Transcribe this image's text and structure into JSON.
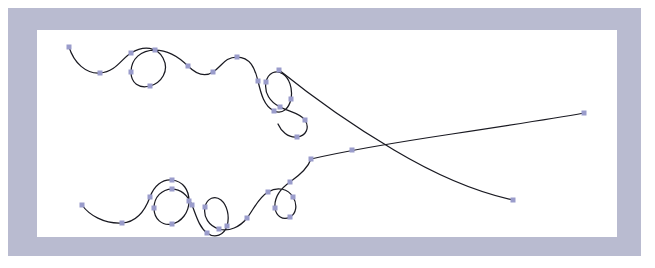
{
  "app": {
    "document_title": "Vector Curve Canvas",
    "view_label": "Artboard"
  },
  "colors": {
    "frame_background": "#b9bbd0",
    "canvas_background": "#ffffff",
    "page_background": "#ffffff",
    "stroke": "#1a1a22",
    "anchor_fill": "#9a9ccb"
  },
  "frame": {
    "x": 8,
    "y": 8,
    "width": 633,
    "height": 248
  },
  "canvas": {
    "x": 37,
    "y": 30,
    "width": 580,
    "height": 207
  },
  "artwork": {
    "stroke_width": 1.25,
    "anchor_size": 5,
    "paths": [
      {
        "id": "upper-path",
        "name": "upper-serpentine-curve",
        "d": "M 69 47 C 74 63 86 74 100 73 C 116 72 122 58 131 53 C 144 45 157 47 163 58 C 170 71 161 83 150 86 C 139 89 131 83 131 72 C 131 59 141 50 155 50 C 170 50 180 58 188 66 C 196 74 204 78 213 72 C 222 66 225 57 237 57 C 250 57 255 68 258 81 C 261 94 264 106 274 111 C 283 115 289 108 291 99 C 293 88 289 78 283 74 C 276 69 268 73 266 82 C 264 93 270 102 280 107 C 290 112 300 113 305 120 C 310 128 306 136 297 137 C 288 138 281 131 278 124"
      },
      {
        "id": "lower-path",
        "name": "lower-serpentine-curve",
        "d": "M 82 205 C 89 215 104 224 122 223 C 139 222 146 208 150 197 C 154 186 162 179 172 180 C 183 181 189 190 189 201 C 189 213 181 222 172 224 C 162 226 154 219 154 208 C 154 197 162 189 172 189 C 182 189 188 196 192 205 C 196 215 199 227 207 233 C 215 239 224 235 227 226 C 230 216 227 205 221 200 C 215 195 207 198 205 207 C 203 217 209 226 219 229 C 229 232 240 227 247 218 C 254 209 258 198 268 192 C 278 186 288 189 293 197 C 298 205 296 214 290 217 C 283 221 276 216 275 208 C 274 198 280 189 290 182 C 300 175 308 168 311 159"
      },
      {
        "id": "diagonal-descending",
        "name": "descending-diagonal-tail",
        "d": "M 279 70 C 310 95 350 124 394 150 C 436 175 476 192 513 200"
      },
      {
        "id": "diagonal-ascending",
        "name": "ascending-diagonal-tail",
        "d": "M 311 159 C 346 151 392 143 452 134 C 505 126 551 119 584 113"
      }
    ],
    "anchors": [
      {
        "x": 69,
        "y": 47,
        "path": "upper-path"
      },
      {
        "x": 100,
        "y": 73,
        "path": "upper-path"
      },
      {
        "x": 131,
        "y": 53,
        "path": "upper-path"
      },
      {
        "x": 150,
        "y": 86,
        "path": "upper-path"
      },
      {
        "x": 131,
        "y": 72,
        "path": "upper-path"
      },
      {
        "x": 155,
        "y": 50,
        "path": "upper-path"
      },
      {
        "x": 188,
        "y": 66,
        "path": "upper-path"
      },
      {
        "x": 213,
        "y": 72,
        "path": "upper-path"
      },
      {
        "x": 237,
        "y": 57,
        "path": "upper-path"
      },
      {
        "x": 258,
        "y": 81,
        "path": "upper-path"
      },
      {
        "x": 274,
        "y": 111,
        "path": "upper-path"
      },
      {
        "x": 291,
        "y": 99,
        "path": "upper-path"
      },
      {
        "x": 266,
        "y": 82,
        "path": "upper-path"
      },
      {
        "x": 280,
        "y": 107,
        "path": "upper-path"
      },
      {
        "x": 305,
        "y": 120,
        "path": "upper-path"
      },
      {
        "x": 297,
        "y": 137,
        "path": "upper-path"
      },
      {
        "x": 279,
        "y": 70,
        "path": "diagonal-descending"
      },
      {
        "x": 513,
        "y": 200,
        "path": "diagonal-descending"
      },
      {
        "x": 311,
        "y": 159,
        "path": "diagonal-ascending"
      },
      {
        "x": 352,
        "y": 150,
        "path": "diagonal-ascending"
      },
      {
        "x": 584,
        "y": 113,
        "path": "diagonal-ascending"
      },
      {
        "x": 82,
        "y": 205,
        "path": "lower-path"
      },
      {
        "x": 122,
        "y": 223,
        "path": "lower-path"
      },
      {
        "x": 150,
        "y": 197,
        "path": "lower-path"
      },
      {
        "x": 172,
        "y": 180,
        "path": "lower-path"
      },
      {
        "x": 189,
        "y": 201,
        "path": "lower-path"
      },
      {
        "x": 172,
        "y": 224,
        "path": "lower-path"
      },
      {
        "x": 154,
        "y": 208,
        "path": "lower-path"
      },
      {
        "x": 172,
        "y": 189,
        "path": "lower-path"
      },
      {
        "x": 192,
        "y": 205,
        "path": "lower-path"
      },
      {
        "x": 207,
        "y": 233,
        "path": "lower-path"
      },
      {
        "x": 227,
        "y": 226,
        "path": "lower-path"
      },
      {
        "x": 205,
        "y": 207,
        "path": "lower-path"
      },
      {
        "x": 219,
        "y": 229,
        "path": "lower-path"
      },
      {
        "x": 247,
        "y": 218,
        "path": "lower-path"
      },
      {
        "x": 268,
        "y": 192,
        "path": "lower-path"
      },
      {
        "x": 293,
        "y": 197,
        "path": "lower-path"
      },
      {
        "x": 290,
        "y": 217,
        "path": "lower-path"
      },
      {
        "x": 275,
        "y": 208,
        "path": "lower-path"
      },
      {
        "x": 290,
        "y": 182,
        "path": "lower-path"
      }
    ]
  }
}
